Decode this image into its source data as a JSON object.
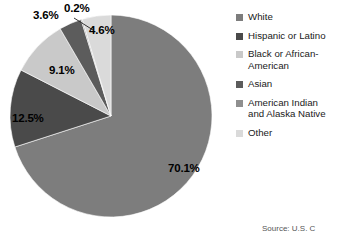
{
  "chart_data": {
    "type": "pie",
    "title": "",
    "subtitle": "",
    "xlabel": "",
    "ylabel": "",
    "grid": false,
    "legend_position": "right",
    "start_angle_deg": 0,
    "direction": "clockwise",
    "categories": [
      "White",
      "Hispanic or Latino",
      "Black or African-American",
      "Asian",
      "American Indian and Alaska Native",
      "Other"
    ],
    "values": [
      70.1,
      12.5,
      9.1,
      3.6,
      0.2,
      4.6
    ],
    "value_labels": [
      "70.1%",
      "12.5%",
      "9.1%",
      "3.6%",
      "0.2%",
      "4.6%"
    ],
    "units": "percent",
    "colors": [
      "#7d7d7d",
      "#4a4a4a",
      "#c9c9c9",
      "#5c5c5c",
      "#8f8f8f",
      "#dadada"
    ],
    "annotations": [
      "Source: U.S. C"
    ]
  },
  "pie": {
    "labels": [
      {
        "text": "70.1%",
        "left": 168,
        "top": 163
      },
      {
        "text": "12.5%",
        "left": 12,
        "top": 113
      },
      {
        "text": "9.1%",
        "left": 49,
        "top": 65
      },
      {
        "text": "3.6%",
        "left": 33,
        "top": 10
      },
      {
        "text": "0.2%",
        "left": 64,
        "top": 3
      },
      {
        "text": "4.6%",
        "left": 89,
        "top": 25
      }
    ]
  },
  "legend": {
    "items": [
      {
        "label": "White",
        "color": "#7d7d7d"
      },
      {
        "label": "Hispanic or Latino",
        "color": "#4a4a4a"
      },
      {
        "label": "Black or African-\nAmerican",
        "color": "#c9c9c9"
      },
      {
        "label": "Asian",
        "color": "#5c5c5c"
      },
      {
        "label": "American Indian\nand Alaska Native",
        "color": "#8f8f8f"
      },
      {
        "label": "Other",
        "color": "#dadada"
      }
    ]
  },
  "source": {
    "text": "Source: U.S. C"
  }
}
